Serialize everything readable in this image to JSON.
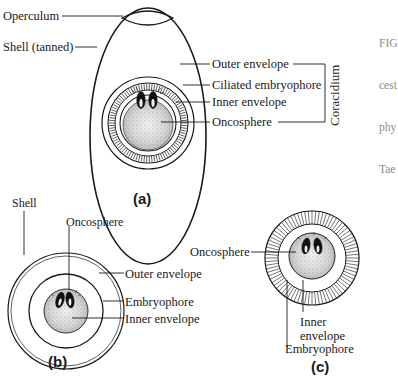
{
  "figure": {
    "caption_fragment": [
      "FIG",
      "cest",
      "phy",
      "Tae"
    ],
    "panels": {
      "a": {
        "label": "(a)",
        "labels": {
          "operculum": "Operculum",
          "shell": "Shell (tanned)",
          "outer_envelope": "Outer envelope",
          "ciliated_embryophore": "Ciliated embryophore",
          "inner_envelope": "Inner envelope",
          "oncosphere": "Oncosphere",
          "group_bracket": "Coracidium"
        }
      },
      "b": {
        "label": "(b)",
        "labels": {
          "shell": "Shell",
          "oncosphere": "Oncosphere",
          "outer_envelope": "Outer envelope",
          "embryophore": "Embryophore",
          "inner_envelope": "Inner envelope"
        }
      },
      "c": {
        "label": "(c)",
        "labels": {
          "oncosphere": "Oncosphere",
          "inner_envelope_line1": "Inner",
          "inner_envelope_line2": "envelope",
          "embryophore": "Embryophore"
        }
      }
    },
    "colors": {
      "line": "#1a1a1a",
      "oncosphere_fill": "#d9d9d9",
      "caption_text": "#8a8a8a"
    }
  }
}
